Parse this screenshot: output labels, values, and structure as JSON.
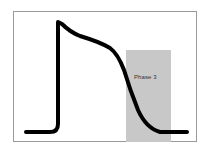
{
  "diagram": {
    "type": "cardiac-action-potential",
    "highlight": {
      "label": "Phase 3",
      "color": "#c8c8c8"
    },
    "frame_color": "#9a9a9a",
    "curve_color": "#000000"
  }
}
